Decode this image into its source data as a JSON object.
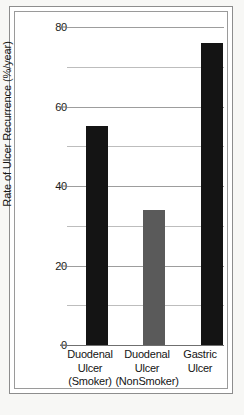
{
  "chart_data": {
    "type": "bar",
    "title": "",
    "xlabel": "",
    "ylabel": "Rate of Ulcer Recurrence (%/year)",
    "ylim": [
      0,
      80
    ],
    "ytick_labels": [
      "0",
      "20",
      "40",
      "60",
      "80"
    ],
    "ytick_values": [
      0,
      20,
      40,
      60,
      80
    ],
    "minor_gridline_values": [
      10,
      30,
      50,
      70
    ],
    "grid": true,
    "legend": "none",
    "categories": [
      "Duodenal Ulcer (Smoker)",
      "Duodenal Ulcer (NonSmoker)",
      "Gastric Ulcer"
    ],
    "category_lines": [
      [
        "Duodenal",
        "Ulcer",
        "(Smoker)"
      ],
      [
        "Duodenal",
        "Ulcer",
        "(NonSmoker)"
      ],
      [
        "Gastric",
        "Ulcer",
        ""
      ]
    ],
    "values": [
      55,
      34,
      76
    ],
    "bar_colors": [
      "#141414",
      "#5a5a5a",
      "#141414"
    ]
  },
  "colors": {
    "bar_black": "#141414",
    "bar_gray": "#5a5a5a",
    "grid": "#bdbdbd",
    "axis": "#6f6f6f",
    "text": "#141414",
    "page_background": "#f7f7f5",
    "plot_background": "#ffffff"
  }
}
